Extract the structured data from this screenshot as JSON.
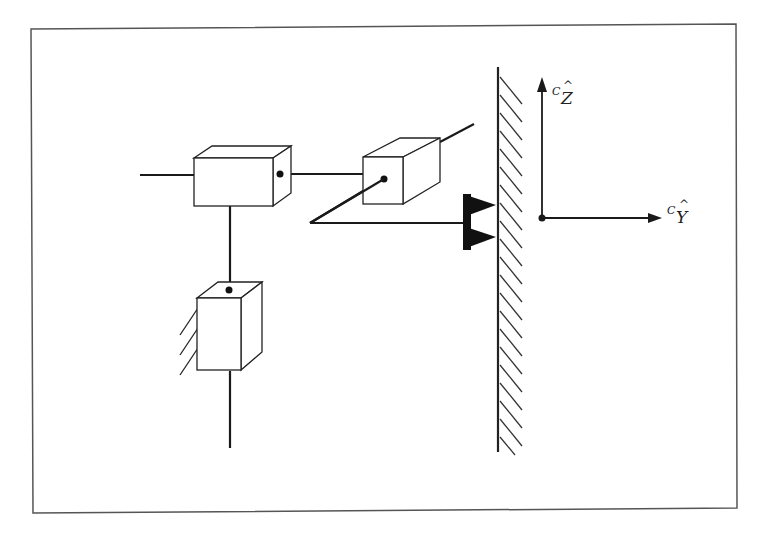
{
  "diagram": {
    "type": "mechanical-linkage-schematic",
    "frame": {
      "stroke": "#555555"
    },
    "colors": {
      "line": "#1a1a1a",
      "fill": "#ffffff",
      "contact": "#111111"
    },
    "axes": {
      "z_axis": {
        "superscript": "C",
        "symbol": "Z",
        "hat": "^"
      },
      "y_axis": {
        "superscript": "C",
        "symbol": "Y",
        "hat": "^"
      }
    },
    "components": [
      {
        "name": "prismatic-joint-1",
        "kind": "box"
      },
      {
        "name": "prismatic-joint-2",
        "kind": "box"
      },
      {
        "name": "prismatic-joint-3-grounded",
        "kind": "box"
      },
      {
        "name": "wall",
        "kind": "hatched-surface"
      },
      {
        "name": "end-effector-contact",
        "kind": "double-point-contact"
      }
    ]
  }
}
